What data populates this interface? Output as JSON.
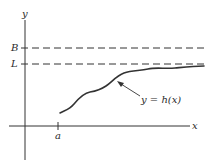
{
  "diagram": {
    "type": "function-graph",
    "axes": {
      "x_label": "x",
      "y_label": "y"
    },
    "horizontal_lines": [
      {
        "label": "B",
        "style": "dashed"
      },
      {
        "label": "L",
        "style": "dashed"
      }
    ],
    "x_tick": {
      "label": "a"
    },
    "curve": {
      "label": "y = h(x)",
      "description": "increasing curve starting at x = a, approaching L from below"
    },
    "colors": {
      "stroke": "#333333",
      "background": "#ffffff"
    }
  }
}
